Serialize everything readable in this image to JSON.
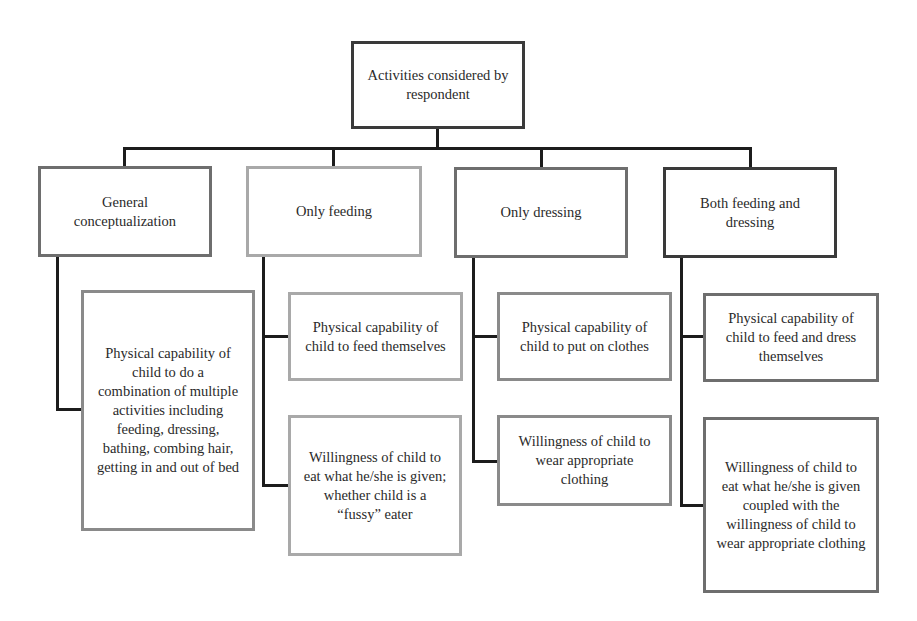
{
  "diagram": {
    "root": {
      "label": "Activities considered by respondent"
    },
    "categories": [
      {
        "label": "General conceptualization",
        "children": [
          "Physical capability of child to do a combination of multiple activities including feeding, dressing, bathing, combing hair, getting in and out of bed"
        ]
      },
      {
        "label": "Only feeding",
        "children": [
          "Physical capability of child to feed themselves",
          "Willingness of child to eat what he/she is given; whether child is a “fussy” eater"
        ]
      },
      {
        "label": "Only dressing",
        "children": [
          "Physical capability of child to put on clothes",
          "Willingness of child to wear appropriate clothing"
        ]
      },
      {
        "label": "Both feeding and dressing",
        "children": [
          "Physical capability of child to feed and dress themselves",
          "Willingness of child to eat what he/she is given coupled with the willingness of child to wear appropriate clothing"
        ]
      }
    ]
  }
}
